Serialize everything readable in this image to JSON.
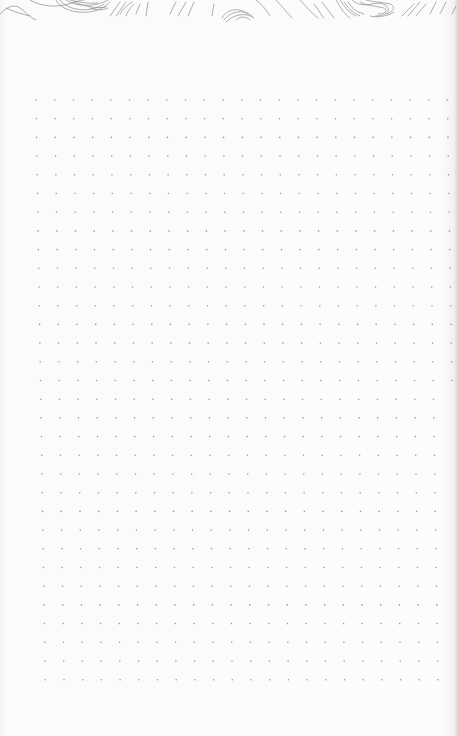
{
  "page": {
    "kind": "dot-grid notebook page",
    "background_color": "#fbfbfb",
    "dot_color": "#9a9a9a",
    "contour_line_color": "#8c8c8c"
  },
  "dot_grid": {
    "origin_x": 36,
    "origin_y": 100,
    "spacing_x": 18.7,
    "spacing_y": 18.7,
    "columns": 23,
    "rows": 32,
    "skew_x_per_row": 0.3,
    "dot_radius": 0.8
  },
  "decoration": {
    "position": "top",
    "style": "topographic contour lines"
  }
}
